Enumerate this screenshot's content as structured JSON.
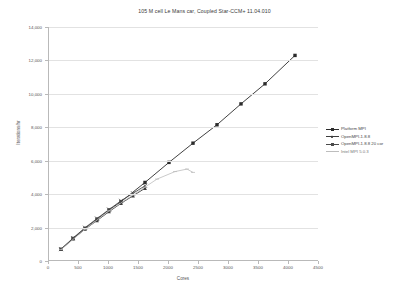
{
  "chart_data": {
    "type": "line",
    "title": "105 M cell Le Mans car, Coupled Star-CCM+ 11.04.010",
    "xlabel": "Cores",
    "ylabel": "Iterations/hr",
    "xlim": [
      0,
      4500
    ],
    "ylim": [
      0,
      14000
    ],
    "xticks": [
      0,
      500,
      1000,
      1500,
      2000,
      2500,
      3000,
      3500,
      4000,
      4500
    ],
    "yticks": [
      0,
      2000,
      4000,
      6000,
      8000,
      10000,
      12000,
      14000
    ],
    "grid": true,
    "legend_position": "right",
    "series": [
      {
        "name": "Platform MPI",
        "color": "#2b2b2b",
        "marker": "square",
        "x": [
          200,
          400,
          600,
          800,
          1000,
          1200,
          1600,
          2000,
          2400,
          2800,
          3200,
          3600,
          4100
        ],
        "y": [
          700,
          1350,
          1950,
          2500,
          3050,
          3550,
          4700,
          5900,
          7050,
          8150,
          9400,
          10600,
          12300
        ]
      },
      {
        "name": "OpenMPI-1.8.8",
        "color": "#3d3d3d",
        "marker": "triangle",
        "x": [
          200,
          400,
          600,
          800,
          1000,
          1200,
          1400,
          1600
        ],
        "y": [
          690,
          1320,
          1900,
          2420,
          2950,
          3450,
          3900,
          4350
        ]
      },
      {
        "name": "OpenMPI-1.8.8 20 cor",
        "color": "#4a4a4a",
        "marker": "cross",
        "x": [
          200,
          400,
          600,
          800,
          1000,
          1200,
          1400,
          1600
        ],
        "y": [
          710,
          1370,
          1990,
          2540,
          3080,
          3600,
          4050,
          4500
        ]
      },
      {
        "name": "Intel MPI 5.0.3",
        "color": "#bdbdbd",
        "marker": "dash",
        "x": [
          200,
          600,
          1000,
          1400,
          1800,
          2100,
          2300,
          2400
        ],
        "y": [
          680,
          1900,
          3000,
          3950,
          4900,
          5350,
          5500,
          5300
        ]
      }
    ]
  }
}
